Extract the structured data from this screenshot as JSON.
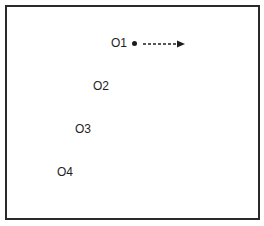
{
  "diagram": {
    "objects": [
      {
        "id": "o1",
        "label": "O1",
        "x": 111,
        "y": 37
      },
      {
        "id": "o2",
        "label": "O2",
        "x": 93,
        "y": 80
      },
      {
        "id": "o3",
        "label": "O3",
        "x": 75,
        "y": 123
      },
      {
        "id": "o4",
        "label": "O4",
        "x": 57,
        "y": 166
      }
    ],
    "marker": {
      "type": "dot",
      "attached_to": "O1"
    },
    "arrow": {
      "style": "dashed",
      "direction": "right",
      "from": "O1"
    },
    "colors": {
      "border": "#2a2a2a",
      "text": "#1e1e1e",
      "background": "#ffffff"
    }
  }
}
